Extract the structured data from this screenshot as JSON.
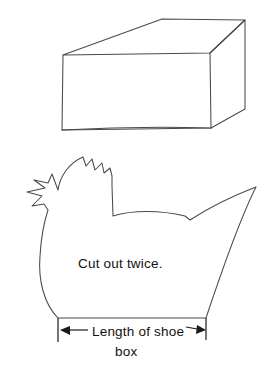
{
  "figure": {
    "background_color": "#ffffff",
    "ink_color": "#4a4a4a",
    "text_color": "#111111",
    "width": 270,
    "height": 373
  },
  "box": {
    "name": "shoe box",
    "description": "Three-dimensional rectangular box drawn in oblique perspective showing top face, front face and right side face"
  },
  "hen": {
    "name": "hen pattern",
    "description": "Hand drawn silhouette of a hen with comb, beak, wattle, rounded breast and pointed tail",
    "caption": "Cut out twice."
  },
  "dimension": {
    "label_line_1": "Length of shoe",
    "label_line_2": "box",
    "arrow_style": "double-headed",
    "left_arrow_x": 60,
    "right_arrow_x": 206,
    "arrow_y": 330
  }
}
